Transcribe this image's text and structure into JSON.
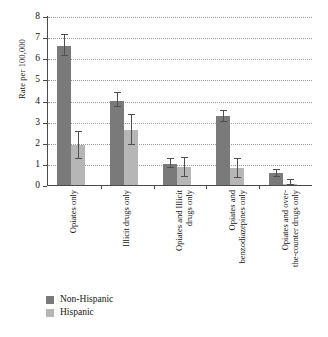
{
  "chart_data": {
    "type": "bar",
    "title": "",
    "subtitle": "",
    "xlabel": "",
    "ylabel": "Rate per 100,000",
    "ylim": [
      0,
      8
    ],
    "yticks": [
      0,
      1,
      2,
      3,
      4,
      5,
      6,
      7,
      8
    ],
    "ytick_labels": [
      "0",
      "1",
      "2",
      "3",
      "4",
      "5",
      "6",
      "7",
      "8"
    ],
    "grid": "horizontal-dotted",
    "legend_position": "bottom-left",
    "error_bars": true,
    "categories": [
      "Opiates only",
      "Illicit drugs only",
      "Opiates and Illicit drugs only",
      "Opiates and benzodiazepines only",
      "Opiates and over-the-counter drugs only"
    ],
    "category_lines": [
      [
        "Opiates only"
      ],
      [
        "Illicit drugs only"
      ],
      [
        "Opiates and Illicit",
        "drugs only"
      ],
      [
        "Opiates and",
        "benzodiazepines only"
      ],
      [
        "Opiates and over-",
        "the-counter drugs only"
      ]
    ],
    "series": [
      {
        "name": "Non-Hispanic",
        "color": "#7a7a7a",
        "values": [
          6.6,
          4.0,
          1.0,
          3.25,
          0.55
        ],
        "err_low": [
          6.1,
          3.7,
          0.8,
          3.0,
          0.4
        ],
        "err_high": [
          7.1,
          4.35,
          1.25,
          3.5,
          0.7
        ]
      },
      {
        "name": "Hispanic",
        "color": "#b6b6b6",
        "values": [
          1.9,
          2.6,
          0.85,
          0.8,
          0.05
        ],
        "err_low": [
          1.25,
          1.9,
          0.4,
          0.35,
          0.0
        ],
        "err_high": [
          2.5,
          3.3,
          1.3,
          1.25,
          0.25
        ]
      }
    ]
  },
  "legend": {
    "items": [
      {
        "label": "Non-Hispanic",
        "color": "#7a7a7a"
      },
      {
        "label": "Hispanic",
        "color": "#b6b6b6"
      }
    ]
  }
}
